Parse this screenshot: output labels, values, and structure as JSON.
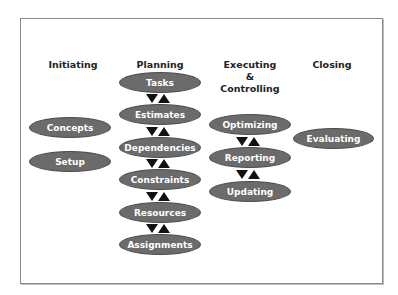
{
  "columns": [
    {
      "header": "Initiating",
      "nodes": [
        "Concepts",
        "Setup"
      ]
    },
    {
      "header": "Planning",
      "nodes": [
        "Tasks",
        "Estimates",
        "Dependencies",
        "Constraints",
        "Resources",
        "Assignments"
      ]
    },
    {
      "header_lines": [
        "Executing",
        "&",
        "Controlling"
      ],
      "nodes": [
        "Optimizing",
        "Reporting",
        "Updating"
      ]
    },
    {
      "header": "Closing",
      "nodes": [
        "Evaluating"
      ]
    }
  ],
  "colors": {
    "node_fill": "#6b6b6b",
    "node_text": "#ffffff",
    "arrow": "#111111",
    "frame_border": "#8a8a8a"
  },
  "icons": {
    "connector": "bidirectional-triangle-arrows"
  }
}
